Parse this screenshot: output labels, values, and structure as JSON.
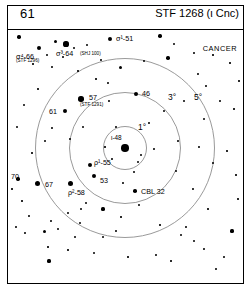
{
  "header": {
    "left_number": "61",
    "title": "STF 1268 (ι Cnc)"
  },
  "constellation_label": "CANCER",
  "circles": [
    {
      "label": "1°",
      "radius_deg": 1
    },
    {
      "label": "3°",
      "radius_deg": 3
    },
    {
      "label": "5°",
      "radius_deg": 5
    }
  ],
  "center_star": {
    "label": "ι-48"
  },
  "star_labels": [
    {
      "name": "sigma4-66",
      "text": "σ⁴-66",
      "sub": "(STF 1296)"
    },
    {
      "name": "sigma3-64",
      "text": "σ³-64",
      "sub": "(SHJ 100)"
    },
    {
      "name": "sigma1-51",
      "text": "σ¹-51",
      "sub": ""
    },
    {
      "name": "star-61",
      "text": "61",
      "sub": ""
    },
    {
      "name": "star-57",
      "text": "57",
      "sub": "(STF 1291)"
    },
    {
      "name": "star-46",
      "text": "46",
      "sub": ""
    },
    {
      "name": "rho1-55",
      "text": "ρ¹-55",
      "sub": ""
    },
    {
      "name": "star-53",
      "text": "53",
      "sub": ""
    },
    {
      "name": "rho2-58",
      "text": "ρ²-58",
      "sub": ""
    },
    {
      "name": "star-70",
      "text": "70",
      "sub": ""
    },
    {
      "name": "star-67",
      "text": "67",
      "sub": ""
    },
    {
      "name": "cbl-32",
      "text": "CBL 32",
      "sub": ""
    }
  ],
  "chart_data": {
    "type": "scatter",
    "title": "STF 1268 (ι Cnc)",
    "xlabel": "",
    "ylabel": "",
    "xlim": [
      0,
      235
    ],
    "ylim": [
      0,
      252
    ],
    "grid": false,
    "legend": "none",
    "annotations": [
      "CANCER",
      "1°",
      "3°",
      "5°"
    ],
    "center": {
      "x": 117,
      "y": 117,
      "label": "ι-48",
      "size": 7.6
    },
    "rings": [
      {
        "cx": 117,
        "cy": 117,
        "r": 22,
        "label": "1°",
        "label_x": 130,
        "label_y": 92
      },
      {
        "cx": 117,
        "cy": 117,
        "r": 56,
        "label": "3°",
        "label_x": 160,
        "label_y": 62
      },
      {
        "cx": 117,
        "cy": 117,
        "r": 90,
        "label": "5°",
        "label_x": 186,
        "label_y": 62
      }
    ],
    "labeled_stars": [
      {
        "label": "σ⁴-66",
        "sub": "(STF 1296)",
        "x": 31,
        "y": 17,
        "size": 4.2,
        "lx": 8,
        "ly": 22,
        "sx": 8,
        "sy": 28
      },
      {
        "label": "σ³-64",
        "sub": "(SHJ 100)",
        "x": 58,
        "y": 13,
        "size": 5.2,
        "lx": 48,
        "ly": 19,
        "sx": 72,
        "sy": 21
      },
      {
        "label": "σ¹-51",
        "sub": "",
        "x": 102,
        "y": 8,
        "size": 4.0,
        "lx": 108,
        "ly": 4
      },
      {
        "label": "61",
        "sub": "",
        "x": 57,
        "y": 80,
        "size": 4.4,
        "lx": 41,
        "ly": 77
      },
      {
        "label": "57",
        "sub": "(STF 1291)",
        "x": 73,
        "y": 68,
        "size": 5.4,
        "lx": 81,
        "ly": 63,
        "sx": 72,
        "sy": 72
      },
      {
        "label": "46",
        "sub": "",
        "x": 128,
        "y": 63,
        "size": 4.2,
        "lx": 134,
        "ly": 59
      },
      {
        "label": "ρ¹-55",
        "sub": "",
        "x": 82,
        "y": 134,
        "size": 4.0,
        "lx": 86,
        "ly": 128
      },
      {
        "label": "53",
        "sub": "",
        "x": 86,
        "y": 145,
        "size": 4.2,
        "lx": 92,
        "ly": 146
      },
      {
        "label": "ρ²-58",
        "sub": "",
        "x": 62,
        "y": 152,
        "size": 5.0,
        "lx": 60,
        "ly": 158
      },
      {
        "label": "70",
        "sub": "",
        "x": 10,
        "y": 148,
        "size": 3.4,
        "lx": 3,
        "ly": 142
      },
      {
        "label": "67",
        "sub": "",
        "x": 29,
        "y": 152,
        "size": 5.0,
        "lx": 37,
        "ly": 150
      },
      {
        "label": "CBL 32",
        "sub": "",
        "x": 127,
        "y": 160,
        "size": 3.6,
        "lx": 133,
        "ly": 157
      }
    ],
    "field_stars": [
      {
        "x": 11,
        "y": 6,
        "size": 3.4
      },
      {
        "x": 47,
        "y": 10,
        "size": 3.0
      },
      {
        "x": 66,
        "y": 17,
        "size": 2.6
      },
      {
        "x": 79,
        "y": 14,
        "size": 2.2
      },
      {
        "x": 39,
        "y": 24,
        "size": 2.0
      },
      {
        "x": 55,
        "y": 26,
        "size": 1.8
      },
      {
        "x": 25,
        "y": 33,
        "size": 1.6
      },
      {
        "x": 44,
        "y": 36,
        "size": 1.8
      },
      {
        "x": 70,
        "y": 40,
        "size": 1.6
      },
      {
        "x": 93,
        "y": 29,
        "size": 1.8
      },
      {
        "x": 112,
        "y": 36,
        "size": 3.0
      },
      {
        "x": 136,
        "y": 30,
        "size": 2.2
      },
      {
        "x": 152,
        "y": 5,
        "size": 3.4
      },
      {
        "x": 166,
        "y": 13,
        "size": 2.0
      },
      {
        "x": 186,
        "y": 22,
        "size": 1.8
      },
      {
        "x": 205,
        "y": 24,
        "size": 1.6
      },
      {
        "x": 160,
        "y": 27,
        "size": 3.4
      },
      {
        "x": 190,
        "y": 43,
        "size": 1.8
      },
      {
        "x": 222,
        "y": 32,
        "size": 1.6
      },
      {
        "x": 231,
        "y": 50,
        "size": 1.6
      },
      {
        "x": 100,
        "y": 52,
        "size": 1.8
      },
      {
        "x": 88,
        "y": 48,
        "size": 1.6
      },
      {
        "x": 30,
        "y": 58,
        "size": 1.6
      },
      {
        "x": 16,
        "y": 74,
        "size": 2.0
      },
      {
        "x": 9,
        "y": 96,
        "size": 2.0
      },
      {
        "x": 44,
        "y": 97,
        "size": 1.8
      },
      {
        "x": 37,
        "y": 110,
        "size": 2.4
      },
      {
        "x": 24,
        "y": 122,
        "size": 1.6
      },
      {
        "x": 62,
        "y": 108,
        "size": 1.8
      },
      {
        "x": 75,
        "y": 96,
        "size": 2.6
      },
      {
        "x": 101,
        "y": 70,
        "size": 1.8
      },
      {
        "x": 108,
        "y": 96,
        "size": 1.8
      },
      {
        "x": 141,
        "y": 92,
        "size": 1.8
      },
      {
        "x": 156,
        "y": 80,
        "size": 2.0
      },
      {
        "x": 176,
        "y": 70,
        "size": 2.4
      },
      {
        "x": 198,
        "y": 55,
        "size": 1.8
      },
      {
        "x": 212,
        "y": 70,
        "size": 1.8
      },
      {
        "x": 226,
        "y": 78,
        "size": 1.6
      },
      {
        "x": 196,
        "y": 88,
        "size": 2.8
      },
      {
        "x": 170,
        "y": 110,
        "size": 1.8
      },
      {
        "x": 191,
        "y": 116,
        "size": 1.8
      },
      {
        "x": 146,
        "y": 118,
        "size": 1.8
      },
      {
        "x": 130,
        "y": 131,
        "size": 2.6
      },
      {
        "x": 133,
        "y": 124,
        "size": 2.2
      },
      {
        "x": 126,
        "y": 141,
        "size": 2.0
      },
      {
        "x": 104,
        "y": 128,
        "size": 1.8
      },
      {
        "x": 115,
        "y": 152,
        "size": 1.8
      },
      {
        "x": 97,
        "y": 116,
        "size": 1.6
      },
      {
        "x": 168,
        "y": 140,
        "size": 2.8
      },
      {
        "x": 205,
        "y": 132,
        "size": 1.8
      },
      {
        "x": 219,
        "y": 120,
        "size": 1.6
      },
      {
        "x": 185,
        "y": 158,
        "size": 1.8
      },
      {
        "x": 131,
        "y": 174,
        "size": 1.8
      },
      {
        "x": 73,
        "y": 178,
        "size": 2.6
      },
      {
        "x": 78,
        "y": 172,
        "size": 2.0
      },
      {
        "x": 95,
        "y": 178,
        "size": 3.2
      },
      {
        "x": 60,
        "y": 182,
        "size": 1.8
      },
      {
        "x": 43,
        "y": 190,
        "size": 1.8
      },
      {
        "x": 21,
        "y": 185,
        "size": 1.8
      },
      {
        "x": 8,
        "y": 196,
        "size": 1.8
      },
      {
        "x": 36,
        "y": 200,
        "size": 3.0
      },
      {
        "x": 50,
        "y": 198,
        "size": 2.2
      },
      {
        "x": 17,
        "y": 202,
        "size": 1.8
      },
      {
        "x": 40,
        "y": 216,
        "size": 1.6
      },
      {
        "x": 72,
        "y": 192,
        "size": 2.2
      },
      {
        "x": 67,
        "y": 206,
        "size": 2.2
      },
      {
        "x": 60,
        "y": 219,
        "size": 1.6
      },
      {
        "x": 41,
        "y": 230,
        "size": 3.2
      },
      {
        "x": 86,
        "y": 222,
        "size": 2.0
      },
      {
        "x": 95,
        "y": 206,
        "size": 2.4
      },
      {
        "x": 108,
        "y": 200,
        "size": 1.8
      },
      {
        "x": 120,
        "y": 226,
        "size": 1.6
      },
      {
        "x": 148,
        "y": 224,
        "size": 1.8
      },
      {
        "x": 163,
        "y": 230,
        "size": 1.6
      },
      {
        "x": 178,
        "y": 196,
        "size": 1.8
      },
      {
        "x": 173,
        "y": 204,
        "size": 2.0
      },
      {
        "x": 186,
        "y": 210,
        "size": 2.8
      },
      {
        "x": 196,
        "y": 218,
        "size": 1.8
      },
      {
        "x": 208,
        "y": 238,
        "size": 1.8
      },
      {
        "x": 224,
        "y": 200,
        "size": 3.2
      },
      {
        "x": 216,
        "y": 226,
        "size": 1.8
      },
      {
        "x": 230,
        "y": 168,
        "size": 1.6
      },
      {
        "x": 200,
        "y": 178,
        "size": 1.6
      },
      {
        "x": 152,
        "y": 194,
        "size": 1.6
      },
      {
        "x": 113,
        "y": 186,
        "size": 1.6
      },
      {
        "x": 228,
        "y": 144,
        "size": 1.6
      },
      {
        "x": 4,
        "y": 158,
        "size": 1.6
      },
      {
        "x": 14,
        "y": 170,
        "size": 1.6
      }
    ]
  }
}
